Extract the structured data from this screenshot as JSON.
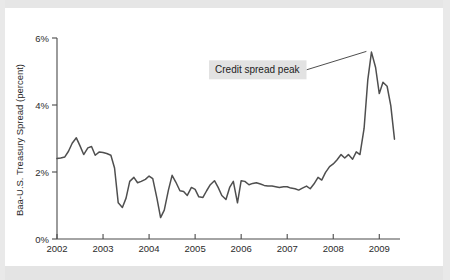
{
  "figure": {
    "background_color": "#ffffff",
    "page_color": "#e9e9e9",
    "line_color": "#4f4f4f",
    "axis_color": "#4a4a4a",
    "annotation_bg": "#e2e2e2"
  },
  "chart_data": {
    "type": "line",
    "title": "",
    "xlabel": "",
    "ylabel": "Baa-U.S. Treasury Spread (percent)",
    "xlim": [
      2002.0,
      2009.45
    ],
    "ylim": [
      0,
      6
    ],
    "grid": false,
    "legend": null,
    "xticks": [
      2002,
      2003,
      2004,
      2005,
      2006,
      2007,
      2008,
      2009
    ],
    "xtick_labels": [
      "2002",
      "2003",
      "2004",
      "2005",
      "2006",
      "2007",
      "2008",
      "2009"
    ],
    "yticks": [
      0,
      2,
      4,
      6
    ],
    "ytick_labels": [
      "0%",
      "2%",
      "4%",
      "6%"
    ],
    "annotations": [
      {
        "text": "Credit spread peak",
        "x": 2006.35,
        "y": 5.05,
        "target_x": 2008.72,
        "target_y": 5.6,
        "boxed": true
      }
    ],
    "series": [
      {
        "name": "Baa-U.S. Treasury Spread",
        "x": [
          2002.0,
          2002.08,
          2002.17,
          2002.25,
          2002.33,
          2002.42,
          2002.5,
          2002.58,
          2002.67,
          2002.75,
          2002.83,
          2002.92,
          2003.0,
          2003.08,
          2003.17,
          2003.25,
          2003.33,
          2003.42,
          2003.5,
          2003.58,
          2003.67,
          2003.75,
          2003.83,
          2003.92,
          2004.0,
          2004.08,
          2004.17,
          2004.25,
          2004.33,
          2004.42,
          2004.5,
          2004.58,
          2004.67,
          2004.75,
          2004.83,
          2004.92,
          2005.0,
          2005.08,
          2005.17,
          2005.25,
          2005.33,
          2005.42,
          2005.5,
          2005.58,
          2005.67,
          2005.75,
          2005.83,
          2005.92,
          2006.0,
          2006.08,
          2006.17,
          2006.25,
          2006.33,
          2006.42,
          2006.5,
          2006.58,
          2006.67,
          2006.75,
          2006.83,
          2006.92,
          2007.0,
          2007.08,
          2007.17,
          2007.25,
          2007.33,
          2007.42,
          2007.5,
          2007.58,
          2007.67,
          2007.75,
          2007.83,
          2007.92,
          2008.0,
          2008.08,
          2008.17,
          2008.25,
          2008.33,
          2008.42,
          2008.5,
          2008.58,
          2008.67,
          2008.75,
          2008.83,
          2008.92,
          2009.0,
          2009.08,
          2009.17,
          2009.25,
          2009.33
        ],
        "values": [
          2.4,
          2.42,
          2.45,
          2.62,
          2.86,
          3.02,
          2.78,
          2.52,
          2.72,
          2.76,
          2.5,
          2.6,
          2.58,
          2.55,
          2.5,
          2.12,
          1.08,
          0.94,
          1.22,
          1.72,
          1.84,
          1.68,
          1.72,
          1.78,
          1.88,
          1.8,
          1.22,
          0.64,
          0.86,
          1.46,
          1.9,
          1.7,
          1.44,
          1.42,
          1.3,
          1.54,
          1.48,
          1.26,
          1.24,
          1.44,
          1.62,
          1.74,
          1.54,
          1.3,
          1.18,
          1.54,
          1.72,
          1.08,
          1.74,
          1.72,
          1.62,
          1.66,
          1.68,
          1.64,
          1.6,
          1.58,
          1.58,
          1.56,
          1.54,
          1.56,
          1.56,
          1.52,
          1.5,
          1.46,
          1.52,
          1.58,
          1.5,
          1.64,
          1.84,
          1.76,
          1.98,
          2.16,
          2.24,
          2.36,
          2.52,
          2.42,
          2.52,
          2.38,
          2.6,
          2.52,
          3.3,
          4.74,
          5.58,
          5.12,
          4.34,
          4.68,
          4.56,
          3.98,
          2.98
        ]
      }
    ]
  }
}
